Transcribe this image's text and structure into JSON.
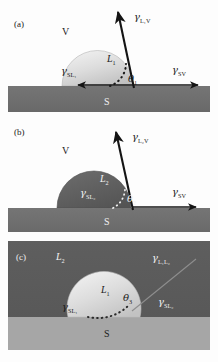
{
  "figure": {
    "type": "contact-angle-wetting-diagram",
    "panel_count": 3,
    "colors": {
      "background": "#fdfdfd",
      "substrate_dark": "#6e6e6e",
      "substrate_light": "#a6a6a6",
      "droplet_light": "#d9d9d9",
      "droplet_dark": "#5f5f5f",
      "medium_dark": "#5a5a5a",
      "arrow": "#141414",
      "text_dark": "#1b1b1b",
      "text_light": "#f2f2f2"
    }
  },
  "panels": [
    {
      "id": "a",
      "label": "(a)",
      "description": "Liquid L1 droplet on solid S in vapor V",
      "phases": {
        "vapor": "V",
        "liquid": "L",
        "liquid_sub": "1",
        "solid": "S"
      },
      "tensions": [
        {
          "name": "gamma-lv",
          "symbol": "γ",
          "sub": "L₁V",
          "sub_main": "L",
          "sub_small": "1",
          "sub_tail": "V"
        },
        {
          "name": "gamma-sl",
          "symbol": "γ",
          "sub": "SL₁",
          "sub_main": "SL",
          "sub_small": "1",
          "sub_tail": ""
        },
        {
          "name": "gamma-sv",
          "symbol": "γ",
          "sub": "SV",
          "sub_main": "SV",
          "sub_small": "",
          "sub_tail": ""
        }
      ],
      "angle": {
        "symbol": "θ",
        "sub": "1"
      },
      "droplet": {
        "fill": "light",
        "contact_angle_deg": 72
      }
    },
    {
      "id": "b",
      "label": "(b)",
      "description": "Liquid L2 droplet on solid S in vapor V, larger contact angle",
      "phases": {
        "vapor": "V",
        "liquid": "L",
        "liquid_sub": "2",
        "solid": "S"
      },
      "tensions": [
        {
          "name": "gamma-lv",
          "symbol": "γ",
          "sub": "L₂V",
          "sub_main": "L",
          "sub_small": "2",
          "sub_tail": "V"
        },
        {
          "name": "gamma-sl",
          "symbol": "γ",
          "sub": "SL₂",
          "sub_main": "SL",
          "sub_small": "2",
          "sub_tail": ""
        },
        {
          "name": "gamma-sv",
          "symbol": "γ",
          "sub": "SV",
          "sub_main": "SV",
          "sub_small": "",
          "sub_tail": ""
        }
      ],
      "angle": {
        "symbol": "θ",
        "sub": "2"
      },
      "droplet": {
        "fill": "dark",
        "contact_angle_deg": 95
      }
    },
    {
      "id": "c",
      "label": "(c)",
      "description": "Liquid L1 droplet on solid S surrounded by liquid L2",
      "phases": {
        "medium": "L",
        "medium_sub": "2",
        "liquid": "L",
        "liquid_sub": "1",
        "solid": "S"
      },
      "tensions": [
        {
          "name": "gamma-l1l2",
          "symbol": "γ",
          "sub": "L₁L₂",
          "sub_main": "L",
          "sub_small": "1",
          "sub_tail": "L",
          "sub_small2": "2"
        },
        {
          "name": "gamma-sl1",
          "symbol": "γ",
          "sub": "SL₁",
          "sub_main": "SL",
          "sub_small": "1",
          "sub_tail": ""
        },
        {
          "name": "gamma-sl2",
          "symbol": "γ",
          "sub": "SL₂",
          "sub_main": "SL",
          "sub_small": "2",
          "sub_tail": ""
        }
      ],
      "angle": {
        "symbol": "θ",
        "sub": "3"
      },
      "droplet": {
        "fill": "light",
        "contact_angle_deg": 128
      }
    }
  ]
}
